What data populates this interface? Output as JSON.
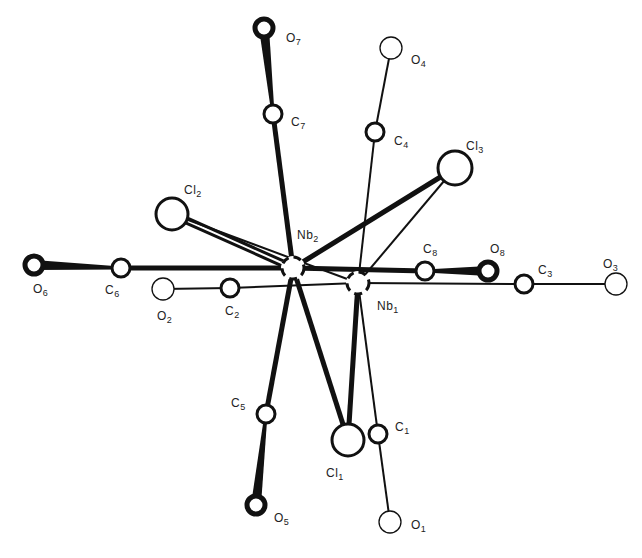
{
  "figure": {
    "colors": {
      "background": "#ffffff",
      "ink": "#111111"
    }
  },
  "atoms": [
    {
      "id": "Nb1",
      "element": "Nb",
      "index": "1",
      "x": 358,
      "y": 283,
      "r": 12,
      "style": "metal",
      "label_x": 377,
      "label_y": 300
    },
    {
      "id": "Nb2",
      "element": "Nb",
      "index": "2",
      "x": 293,
      "y": 268,
      "r": 12,
      "style": "metal",
      "label_x": 297,
      "label_y": 229
    },
    {
      "id": "Cl1",
      "element": "Cl",
      "index": "1",
      "x": 348,
      "y": 440,
      "r": 16,
      "style": "open-thick",
      "label_x": 326,
      "label_y": 467
    },
    {
      "id": "Cl2",
      "element": "Cl",
      "index": "2",
      "x": 172,
      "y": 214,
      "r": 16,
      "style": "open-thick",
      "label_x": 184,
      "label_y": 184
    },
    {
      "id": "Cl3",
      "element": "Cl",
      "index": "3",
      "x": 455,
      "y": 168,
      "r": 17,
      "style": "open-thick",
      "label_x": 466,
      "label_y": 140
    },
    {
      "id": "C1",
      "element": "C",
      "index": "1",
      "x": 378,
      "y": 434,
      "r": 9,
      "style": "open-thick",
      "label_x": 395,
      "label_y": 421
    },
    {
      "id": "C2",
      "element": "C",
      "index": "2",
      "x": 230,
      "y": 288,
      "r": 9,
      "style": "open-thick",
      "label_x": 225,
      "label_y": 305
    },
    {
      "id": "C3",
      "element": "C",
      "index": "3",
      "x": 524,
      "y": 284,
      "r": 9,
      "style": "open-thick",
      "label_x": 538,
      "label_y": 264
    },
    {
      "id": "C4",
      "element": "C",
      "index": "4",
      "x": 375,
      "y": 132,
      "r": 9,
      "style": "open-thick",
      "label_x": 394,
      "label_y": 135
    },
    {
      "id": "C5",
      "element": "C",
      "index": "5",
      "x": 266,
      "y": 414,
      "r": 9,
      "style": "open-thick",
      "label_x": 231,
      "label_y": 397
    },
    {
      "id": "C6",
      "element": "C",
      "index": "6",
      "x": 121,
      "y": 268,
      "r": 9,
      "style": "open-thick",
      "label_x": 105,
      "label_y": 284
    },
    {
      "id": "C7",
      "element": "C",
      "index": "7",
      "x": 273,
      "y": 114,
      "r": 9,
      "style": "open-thick",
      "label_x": 291,
      "label_y": 116
    },
    {
      "id": "C8",
      "element": "C",
      "index": "8",
      "x": 425,
      "y": 271,
      "r": 9,
      "style": "open-thick",
      "label_x": 423,
      "label_y": 243
    },
    {
      "id": "O1",
      "element": "O",
      "index": "1",
      "x": 390,
      "y": 522,
      "r": 11,
      "style": "open-thin",
      "label_x": 411,
      "label_y": 519
    },
    {
      "id": "O2",
      "element": "O",
      "index": "2",
      "x": 163,
      "y": 289,
      "r": 11,
      "style": "open-thin",
      "label_x": 157,
      "label_y": 310
    },
    {
      "id": "O3",
      "element": "O",
      "index": "3",
      "x": 616,
      "y": 284,
      "r": 11,
      "style": "open-thin",
      "label_x": 603,
      "label_y": 258
    },
    {
      "id": "O4",
      "element": "O",
      "index": "4",
      "x": 391,
      "y": 48,
      "r": 11,
      "style": "open-thin",
      "label_x": 411,
      "label_y": 54
    },
    {
      "id": "O5",
      "element": "O",
      "index": "5",
      "x": 256,
      "y": 505,
      "r": 9,
      "style": "filled-ring",
      "label_x": 274,
      "label_y": 512
    },
    {
      "id": "O6",
      "element": "O",
      "index": "6",
      "x": 34,
      "y": 265,
      "r": 9,
      "style": "filled-ring",
      "label_x": 33,
      "label_y": 283
    },
    {
      "id": "O7",
      "element": "O",
      "index": "7",
      "x": 264,
      "y": 28,
      "r": 9,
      "style": "filled-ring",
      "label_x": 286,
      "label_y": 32
    },
    {
      "id": "O8",
      "element": "O",
      "index": "8",
      "x": 488,
      "y": 271,
      "r": 9,
      "style": "filled-ring",
      "label_x": 490,
      "label_y": 243
    }
  ],
  "bonds": [
    {
      "from": "Nb2",
      "to": "C7",
      "style": "thick"
    },
    {
      "from": "C7",
      "to": "O7",
      "style": "wedge"
    },
    {
      "from": "Nb2",
      "to": "C6",
      "style": "thick"
    },
    {
      "from": "C6",
      "to": "O6",
      "style": "wedge"
    },
    {
      "from": "Nb2",
      "to": "C5",
      "style": "thick"
    },
    {
      "from": "C5",
      "to": "O5",
      "style": "wedge"
    },
    {
      "from": "Nb2",
      "to": "C8",
      "style": "thick"
    },
    {
      "from": "C8",
      "to": "O8",
      "style": "wedge"
    },
    {
      "from": "Nb2",
      "to": "Cl2",
      "style": "double-thick"
    },
    {
      "from": "Nb2",
      "to": "Cl3",
      "style": "thick"
    },
    {
      "from": "Nb2",
      "to": "Cl1",
      "style": "thick"
    },
    {
      "from": "Nb1",
      "to": "C4",
      "style": "thin"
    },
    {
      "from": "C4",
      "to": "O4",
      "style": "thin"
    },
    {
      "from": "Nb1",
      "to": "C2",
      "style": "thin"
    },
    {
      "from": "C2",
      "to": "O2",
      "style": "thin"
    },
    {
      "from": "Nb1",
      "to": "C3",
      "style": "thin"
    },
    {
      "from": "C3",
      "to": "O3",
      "style": "thin"
    },
    {
      "from": "Nb1",
      "to": "C1",
      "style": "thin"
    },
    {
      "from": "C1",
      "to": "O1",
      "style": "thin"
    },
    {
      "from": "Nb1",
      "to": "Cl1",
      "style": "thick"
    },
    {
      "from": "Nb1",
      "to": "Cl3",
      "style": "thin"
    },
    {
      "from": "Nb1",
      "to": "Cl2",
      "style": "thin"
    }
  ],
  "labels": [
    {
      "atom": "Nb1",
      "element": "Nb",
      "index": "1"
    },
    {
      "atom": "Nb2",
      "element": "Nb",
      "index": "2"
    },
    {
      "atom": "Cl1",
      "element": "Cl",
      "index": "1"
    },
    {
      "atom": "Cl2",
      "element": "Cl",
      "index": "2"
    },
    {
      "atom": "Cl3",
      "element": "Cl",
      "index": "3"
    },
    {
      "atom": "C1",
      "element": "C",
      "index": "1"
    },
    {
      "atom": "C2",
      "element": "C",
      "index": "2"
    },
    {
      "atom": "C3",
      "element": "C",
      "index": "3"
    },
    {
      "atom": "C4",
      "element": "C",
      "index": "4"
    },
    {
      "atom": "C5",
      "element": "C",
      "index": "5"
    },
    {
      "atom": "C6",
      "element": "C",
      "index": "6"
    },
    {
      "atom": "C7",
      "element": "C",
      "index": "7"
    },
    {
      "atom": "C8",
      "element": "C",
      "index": "8"
    },
    {
      "atom": "O1",
      "element": "O",
      "index": "1"
    },
    {
      "atom": "O2",
      "element": "O",
      "index": "2"
    },
    {
      "atom": "O3",
      "element": "O",
      "index": "3"
    },
    {
      "atom": "O4",
      "element": "O",
      "index": "4"
    },
    {
      "atom": "O5",
      "element": "O",
      "index": "5"
    },
    {
      "atom": "O6",
      "element": "O",
      "index": "6"
    },
    {
      "atom": "O7",
      "element": "O",
      "index": "7"
    },
    {
      "atom": "O8",
      "element": "O",
      "index": "8"
    }
  ]
}
